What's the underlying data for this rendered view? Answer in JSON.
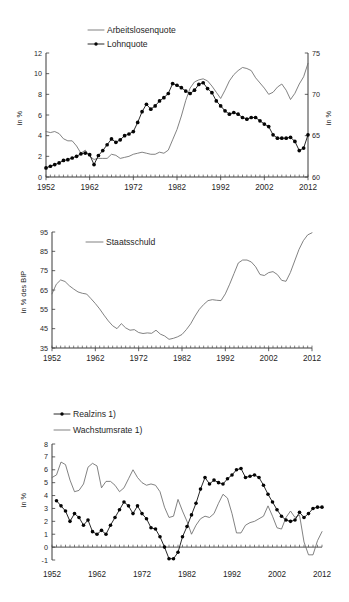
{
  "figure": {
    "panels": [
      "unemployment-wage-share",
      "public-debt",
      "real-interest-growth"
    ]
  },
  "chart_data": [
    {
      "type": "line",
      "id": "chart-arbeitslosenquote-lohnquote",
      "title": "",
      "xlabel": "",
      "ylabel": "in %",
      "y2label": "in %",
      "xlim": [
        1952,
        2012
      ],
      "ylim": [
        0,
        12
      ],
      "y2lim": [
        60,
        75
      ],
      "yticks": [
        0,
        2,
        4,
        6,
        8,
        10,
        12
      ],
      "y2ticks": [
        60,
        65,
        70,
        75
      ],
      "xticks": [
        1952,
        1962,
        1972,
        1982,
        1992,
        2002,
        2012
      ],
      "xticklabels": [
        "1952",
        "1962",
        "1972",
        "1982",
        "1992",
        "2002",
        "2012"
      ],
      "grid": false,
      "legend_position": "top-center",
      "minor_ticks": "annual",
      "series": [
        {
          "name": "Arbeitslosenquote",
          "axis": "left",
          "style": "plain-line",
          "marker": false,
          "x": [
            1952,
            1953,
            1954,
            1955,
            1956,
            1957,
            1958,
            1959,
            1960,
            1961,
            1962,
            1963,
            1964,
            1965,
            1966,
            1967,
            1968,
            1969,
            1970,
            1971,
            1972,
            1973,
            1974,
            1975,
            1976,
            1977,
            1978,
            1979,
            1980,
            1981,
            1982,
            1983,
            1984,
            1985,
            1986,
            1987,
            1988,
            1989,
            1990,
            1991,
            1992,
            1993,
            1994,
            1995,
            1996,
            1997,
            1998,
            1999,
            2000,
            2001,
            2002,
            2003,
            2004,
            2005,
            2006,
            2007,
            2008,
            2009,
            2010,
            2011,
            2012
          ],
          "values": [
            4.4,
            4.3,
            4.4,
            4.2,
            3.7,
            3.5,
            3.5,
            3.0,
            2.3,
            2.6,
            2.0,
            1.7,
            1.8,
            1.8,
            1.8,
            2.2,
            2.1,
            1.8,
            1.9,
            2.0,
            2.2,
            2.3,
            2.4,
            2.3,
            2.2,
            2.2,
            2.4,
            2.3,
            2.6,
            3.6,
            4.6,
            5.9,
            7.4,
            8.6,
            9.2,
            9.4,
            9.5,
            9.3,
            8.8,
            8.2,
            7.6,
            8.4,
            9.3,
            9.9,
            10.3,
            10.6,
            10.5,
            10.3,
            9.6,
            9.1,
            8.6,
            8.0,
            8.2,
            8.7,
            9.0,
            8.4,
            7.5,
            8.1,
            9.0,
            9.7,
            11.0
          ]
        },
        {
          "name": "Lohnquote",
          "axis": "right",
          "style": "marked-line",
          "marker": true,
          "x": [
            1952,
            1953,
            1954,
            1955,
            1956,
            1957,
            1958,
            1959,
            1960,
            1961,
            1962,
            1963,
            1964,
            1965,
            1966,
            1967,
            1968,
            1969,
            1970,
            1971,
            1972,
            1973,
            1974,
            1975,
            1976,
            1977,
            1978,
            1979,
            1980,
            1981,
            1982,
            1983,
            1984,
            1985,
            1986,
            1987,
            1988,
            1989,
            1990,
            1991,
            1992,
            1993,
            1994,
            1995,
            1996,
            1997,
            1998,
            1999,
            2000,
            2001,
            2002,
            2003,
            2004,
            2005,
            2006,
            2007,
            2008,
            2009,
            2010,
            2011,
            2012
          ],
          "values": [
            61.1,
            61.3,
            61.5,
            61.7,
            62.0,
            62.1,
            62.3,
            62.5,
            62.8,
            62.9,
            62.7,
            61.5,
            62.6,
            63.2,
            63.9,
            64.6,
            64.2,
            64.5,
            65.0,
            65.2,
            65.5,
            66.6,
            67.9,
            68.8,
            68.2,
            68.6,
            69.2,
            69.6,
            70.1,
            71.3,
            71.1,
            70.8,
            70.4,
            70.1,
            70.5,
            71.2,
            71.4,
            70.7,
            70.2,
            69.2,
            68.6,
            68.0,
            67.6,
            67.8,
            67.6,
            67.2,
            67.0,
            67.2,
            67.2,
            66.8,
            66.4,
            66.1,
            65.1,
            64.7,
            64.7,
            64.7,
            64.8,
            64.3,
            63.2,
            63.5,
            65.1,
            64.5,
            64.5
          ]
        }
      ]
    },
    {
      "type": "line",
      "id": "chart-staatsschuld",
      "title": "",
      "xlabel": "",
      "ylabel": "in % des BIP",
      "xlim": [
        1952,
        2012
      ],
      "ylim": [
        35,
        95
      ],
      "yticks": [
        35,
        45,
        55,
        65,
        75,
        85,
        95
      ],
      "xticks": [
        1952,
        1962,
        1972,
        1982,
        1992,
        2002,
        2012
      ],
      "xticklabels": [
        "1952",
        "1962",
        "1972",
        "1982",
        "1992",
        "2002",
        "2012"
      ],
      "grid": false,
      "legend_position": "top-left",
      "minor_ticks": "annual",
      "series": [
        {
          "name": "Staatsschuld",
          "style": "plain-line",
          "marker": false,
          "x": [
            1952,
            1953,
            1954,
            1955,
            1956,
            1957,
            1958,
            1959,
            1960,
            1961,
            1962,
            1963,
            1964,
            1965,
            1966,
            1967,
            1968,
            1969,
            1970,
            1971,
            1972,
            1973,
            1974,
            1975,
            1976,
            1977,
            1978,
            1979,
            1980,
            1981,
            1982,
            1983,
            1984,
            1985,
            1986,
            1987,
            1988,
            1989,
            1990,
            1991,
            1992,
            1993,
            1994,
            1995,
            1996,
            1997,
            1998,
            1999,
            2000,
            2001,
            2002,
            2003,
            2004,
            2005,
            2006,
            2007,
            2008,
            2009,
            2010,
            2011,
            2012
          ],
          "values": [
            63.0,
            68.0,
            70.2,
            69.4,
            67.2,
            65.5,
            64.0,
            63.3,
            62.9,
            60.5,
            58.0,
            55.2,
            52.0,
            49.0,
            46.5,
            45.0,
            47.6,
            45.4,
            44.2,
            44.5,
            43.0,
            42.5,
            42.8,
            42.6,
            44.2,
            42.2,
            41.2,
            39.5,
            40.0,
            40.8,
            42.0,
            44.5,
            47.5,
            51.5,
            55.0,
            57.5,
            59.5,
            60.0,
            59.7,
            59.5,
            63.0,
            68.0,
            73.5,
            79.0,
            80.5,
            80.5,
            79.5,
            77.0,
            73.0,
            72.5,
            74.0,
            74.5,
            73.0,
            70.0,
            69.5,
            74.0,
            80.0,
            86.0,
            90.5,
            93.5,
            94.6
          ]
        }
      ]
    },
    {
      "type": "line",
      "id": "chart-realzins-wachstumsrate",
      "title": "",
      "xlabel": "",
      "ylabel": "in %",
      "xlim": [
        1952,
        2012
      ],
      "ylim": [
        -1,
        8
      ],
      "yticks": [
        -1,
        0,
        1,
        2,
        3,
        4,
        5,
        6,
        7,
        8
      ],
      "xticks": [
        1952,
        1962,
        1972,
        1982,
        1992,
        2002,
        2012
      ],
      "xticklabels": [
        "1952",
        "1962",
        "1972",
        "1982",
        "1992",
        "2002",
        "2012"
      ],
      "grid": false,
      "legend_position": "top-left",
      "minor_ticks": "annual",
      "footnote_marker": "1)",
      "series": [
        {
          "name": "Realzins 1)",
          "style": "marked-line",
          "marker": true,
          "x": [
            1953,
            1954,
            1955,
            1956,
            1957,
            1958,
            1959,
            1960,
            1961,
            1962,
            1963,
            1964,
            1965,
            1966,
            1967,
            1968,
            1969,
            1970,
            1971,
            1972,
            1973,
            1974,
            1975,
            1976,
            1977,
            1978,
            1979,
            1980,
            1981,
            1982,
            1983,
            1984,
            1985,
            1986,
            1987,
            1988,
            1989,
            1990,
            1991,
            1992,
            1993,
            1994,
            1995,
            1996,
            1997,
            1998,
            1999,
            2000,
            2001,
            2002,
            2003,
            2004,
            2005,
            2006,
            2007,
            2008,
            2009,
            2010,
            2011,
            2012
          ],
          "values": [
            3.6,
            3.2,
            2.8,
            2.0,
            2.6,
            2.3,
            1.7,
            2.1,
            1.2,
            1.0,
            1.3,
            1.0,
            1.7,
            2.3,
            2.9,
            3.5,
            3.2,
            2.6,
            3.2,
            2.6,
            2.2,
            1.5,
            1.4,
            0.8,
            0.0,
            -0.9,
            -0.9,
            -0.4,
            0.8,
            1.6,
            2.5,
            3.4,
            4.5,
            5.4,
            4.9,
            5.2,
            5.0,
            4.9,
            5.3,
            5.6,
            6.0,
            6.1,
            5.4,
            5.5,
            5.6,
            5.4,
            4.8,
            4.1,
            3.5,
            2.9,
            2.4,
            2.1,
            2.0,
            2.1,
            2.7,
            2.3,
            2.6,
            3.0,
            3.1,
            3.1
          ]
        },
        {
          "name": "Wachstumsrate 1)",
          "style": "plain-line",
          "marker": false,
          "x": [
            1952,
            1953,
            1954,
            1955,
            1956,
            1957,
            1958,
            1959,
            1960,
            1961,
            1962,
            1963,
            1964,
            1965,
            1966,
            1967,
            1968,
            1969,
            1970,
            1971,
            1972,
            1973,
            1974,
            1975,
            1976,
            1977,
            1978,
            1979,
            1980,
            1981,
            1982,
            1983,
            1984,
            1985,
            1986,
            1987,
            1988,
            1989,
            1990,
            1991,
            1992,
            1993,
            1994,
            1995,
            1996,
            1997,
            1998,
            1999,
            2000,
            2001,
            2002,
            2003,
            2004,
            2005,
            2006,
            2007,
            2008,
            2009,
            2010,
            2011,
            2012
          ],
          "values": [
            5.4,
            5.6,
            6.6,
            6.4,
            5.2,
            4.3,
            4.4,
            4.9,
            6.2,
            6.5,
            6.3,
            4.6,
            5.1,
            5.1,
            4.8,
            4.3,
            4.6,
            5.3,
            6.0,
            5.4,
            5.0,
            4.8,
            4.9,
            4.8,
            4.3,
            3.1,
            2.3,
            2.4,
            3.7,
            2.8,
            2.0,
            1.0,
            1.7,
            2.2,
            2.4,
            2.3,
            2.6,
            3.4,
            4.1,
            3.8,
            2.6,
            1.1,
            1.1,
            1.7,
            1.9,
            2.0,
            2.2,
            2.4,
            3.2,
            2.4,
            1.5,
            1.4,
            2.3,
            2.8,
            2.3,
            2.5,
            0.4,
            -0.6,
            -0.6,
            0.5,
            1.2
          ]
        }
      ]
    }
  ]
}
